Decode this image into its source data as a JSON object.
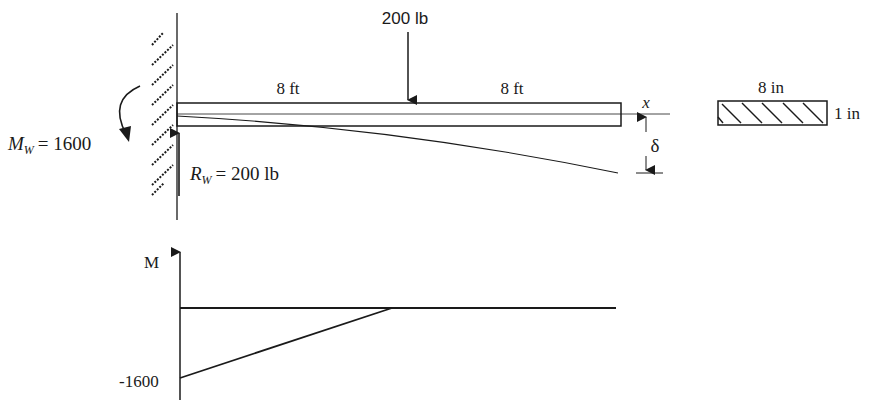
{
  "beam": {
    "load_label": "200 lb",
    "span_left_label": "8 ft",
    "span_right_label": "8 ft",
    "axis_label": "x",
    "deflection_label": "δ",
    "moment_reaction": {
      "symbol": "M",
      "subscript": "W",
      "value": "= 1600"
    },
    "force_reaction": {
      "symbol": "R",
      "subscript": "W",
      "value": "= 200 lb"
    }
  },
  "cross_section": {
    "width_label": "8 in",
    "height_label": "1 in"
  },
  "moment_diagram": {
    "axis_label": "M",
    "min_label": "-1600"
  },
  "colors": {
    "ink": "#1a1a1a",
    "background": "#ffffff"
  }
}
